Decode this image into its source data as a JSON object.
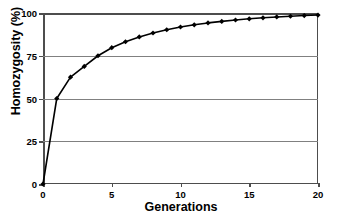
{
  "chart_data": {
    "type": "line",
    "title": "",
    "subtitle": "",
    "xlabel": "Generations",
    "ylabel": "Homozygosity (%)",
    "xlim": [
      0,
      20
    ],
    "ylim": [
      0,
      100
    ],
    "xticks": [
      0,
      5,
      10,
      15,
      20
    ],
    "yticks": [
      0,
      25,
      50,
      75,
      100
    ],
    "xtick_labels": [
      "0",
      "5",
      "10",
      "15",
      "20"
    ],
    "ytick_labels": [
      "0",
      "25",
      "50",
      "75",
      "100"
    ],
    "grid": "horizontal",
    "legend": "none",
    "marker": "diamond",
    "line_color": "#000000",
    "marker_color": "#000000",
    "grid_color": "#808080",
    "axis_color": "#4d4d4d",
    "background": "#ffffff",
    "x": [
      0,
      1,
      2,
      3,
      4,
      5,
      6,
      7,
      8,
      9,
      10,
      11,
      12,
      13,
      14,
      15,
      16,
      17,
      18,
      19,
      20
    ],
    "series": [
      {
        "name": "Homozygosity",
        "values": [
          0,
          50,
          62.5,
          68.75,
          75,
          79.7,
          83.2,
          86,
          88.3,
          90.2,
          91.8,
          93.1,
          94.2,
          95.1,
          95.9,
          96.6,
          97.2,
          97.7,
          98.1,
          98.5,
          98.8
        ]
      }
    ]
  },
  "axes": {
    "y_title": "Homozygosity (%)",
    "x_title": "Generations"
  }
}
